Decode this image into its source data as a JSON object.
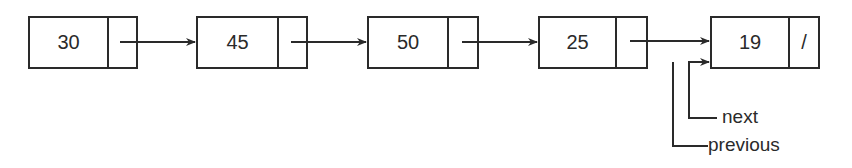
{
  "diagram": {
    "type": "linked-list",
    "nodes": [
      {
        "value": "30",
        "pointer": ""
      },
      {
        "value": "45",
        "pointer": ""
      },
      {
        "value": "50",
        "pointer": ""
      },
      {
        "value": "25",
        "pointer": ""
      },
      {
        "value": "19",
        "pointer": "/"
      }
    ],
    "labels": {
      "next": "next",
      "previous": "previous"
    },
    "colors": {
      "stroke": "#2a2a2a",
      "background": "#ffffff"
    }
  }
}
